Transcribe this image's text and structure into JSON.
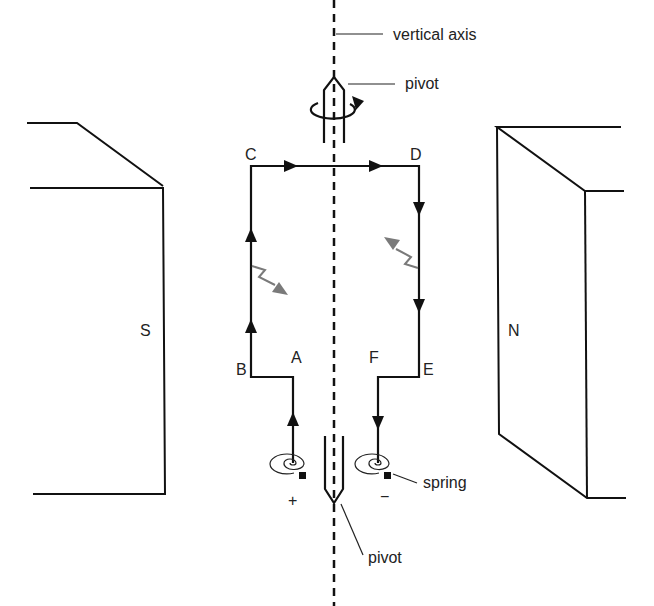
{
  "diagram": {
    "labels": {
      "vertical_axis": "vertical axis",
      "pivot_top": "pivot",
      "pivot_bottom": "pivot",
      "spring": "spring",
      "magnet_south": "S",
      "magnet_north": "N",
      "point_a": "A",
      "point_b": "B",
      "point_c": "C",
      "point_d": "D",
      "point_e": "E",
      "point_f": "F",
      "terminal_positive": "+",
      "terminal_negative": "−"
    },
    "colors": {
      "line": "#111111",
      "force_arrow": "#7a7a7a",
      "background": "#ffffff"
    },
    "current_direction": "A→B→C→D→E→F",
    "force_arrows": [
      {
        "side": "BC",
        "direction": "down-right (out)"
      },
      {
        "side": "DE",
        "direction": "up-left (in)"
      }
    ],
    "rotation_indicator": "clockwise-arrow-around-top-pivot"
  }
}
